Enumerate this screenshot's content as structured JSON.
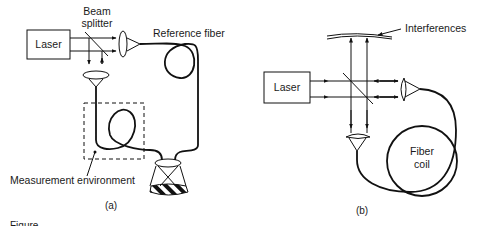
{
  "panel_a": {
    "caption": "(a)",
    "laser_label": "Laser",
    "beam_splitter_label_line1": "Beam",
    "beam_splitter_label_line2": "splitter",
    "reference_fiber_label": "Reference fiber",
    "measurement_environment_label": "Measurement environment"
  },
  "panel_b": {
    "caption": "(b)",
    "laser_label": "Laser",
    "interferences_label": "Interferences",
    "fiber_coil_label_line1": "Fiber",
    "fiber_coil_label_line2": "coil"
  },
  "figure_caption_partial": "Figure"
}
